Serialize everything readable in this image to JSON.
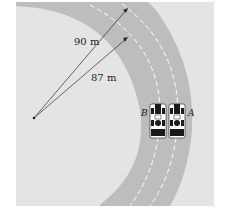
{
  "diagram": {
    "labels": {
      "outer_radius": "90 m",
      "inner_radius": "87 m",
      "car_a": "A",
      "car_b": "B"
    },
    "colors": {
      "background": "#e4e4e4",
      "track": "#bdbdbd",
      "track_edge": "#a8a8a8",
      "lane_marks": "#ffffff",
      "lines": "#2a2a2a"
    },
    "elements": {
      "center_point": "center",
      "radius_lines": [
        "90 m",
        "87 m"
      ],
      "cars": [
        "A",
        "B"
      ]
    }
  }
}
